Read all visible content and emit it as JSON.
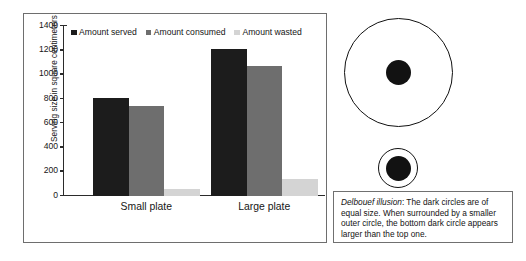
{
  "chart_data": {
    "type": "bar",
    "title": "",
    "xlabel": "",
    "ylabel": "Serving size in square centimeters",
    "categories": [
      "Small plate",
      "Large plate"
    ],
    "series": [
      {
        "name": "Amount served",
        "color": "#1c1c1c",
        "values": [
          805,
          1215
        ]
      },
      {
        "name": "Amount consumed",
        "color": "#6e6e6e",
        "values": [
          740,
          1070
        ]
      },
      {
        "name": "Amount wasted",
        "color": "#d4d4d4",
        "values": [
          60,
          140
        ]
      }
    ],
    "ylim": [
      0,
      1400
    ],
    "ytick_step": 200,
    "yticks": [
      0,
      200,
      400,
      600,
      800,
      1000,
      1200,
      1400
    ],
    "ytick_labels": [
      "0",
      "200",
      "400",
      "600",
      "800",
      "1000",
      "1200",
      "1400"
    ],
    "grid": false,
    "legend_position": "top-inside"
  },
  "illusion": {
    "figure_name": "Delboeuf illusion",
    "outer_circle_large_label": "large outer circle",
    "outer_circle_small_label": "small outer circle",
    "inner_circle_label": "dark circle",
    "stroke_color": "#111111",
    "fill_color": "#121212"
  },
  "caption": {
    "term": "Delbouef illusion",
    "body": ": The dark circles are of equal size. When surrounded by a smaller outer circle, the bottom dark circle appears larger than the top one."
  }
}
